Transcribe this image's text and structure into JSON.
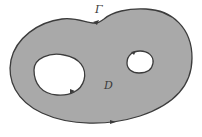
{
  "figure": {
    "labels": {
      "boundary": "Γ",
      "region": "D"
    },
    "colors": {
      "region_fill": "#a9a9a9",
      "boundary_stroke": "#3c3c3c",
      "hole_fill": "#ffffff",
      "background": "#ffffff"
    },
    "elements": [
      {
        "name": "outer-boundary",
        "label": "Γ",
        "orientation": "counterclockwise"
      },
      {
        "name": "hole-left",
        "orientation": "clockwise"
      },
      {
        "name": "hole-right",
        "orientation": "clockwise"
      }
    ]
  }
}
